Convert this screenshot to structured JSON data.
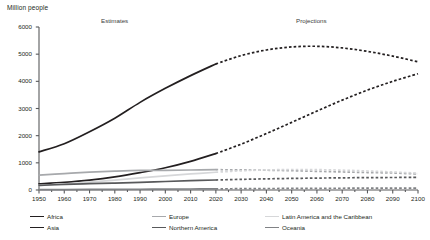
{
  "axis": {
    "ylabel": "Million people",
    "yticks": [
      0,
      1000,
      2000,
      3000,
      4000,
      5000,
      6000
    ],
    "ytick_labels": [
      "0",
      "1000",
      "2000",
      "3000",
      "4000",
      "5000",
      "6000"
    ],
    "xticks": [
      1950,
      1960,
      1970,
      1980,
      1990,
      2000,
      2010,
      2020,
      2030,
      2040,
      2050,
      2060,
      2070,
      2080,
      2090,
      2100
    ],
    "xtick_labels": [
      "1950",
      "1960",
      "1970",
      "1980",
      "1990",
      "2000",
      "2010",
      "2020",
      "2030",
      "2040",
      "2050",
      "2060",
      "2070",
      "2080",
      "2090",
      "2100"
    ]
  },
  "annotations": {
    "estimates": "Estimates",
    "projections": "Projections"
  },
  "legend": {
    "items": [
      {
        "label": "Africa",
        "color": "#231f20"
      },
      {
        "label": "Europe",
        "color": "#a7a9ac"
      },
      {
        "label": "Latin America and the Caribbean",
        "color": "#d6d7d9"
      },
      {
        "label": "Asia",
        "color": "#231f20"
      },
      {
        "label": "Northern America",
        "color": "#58595b"
      },
      {
        "label": "Oceania",
        "color": "#808285"
      }
    ]
  },
  "chart_data": {
    "type": "line",
    "title": "",
    "subtitle": "",
    "xlabel": "",
    "ylabel": "Million people",
    "xlim": [
      1950,
      2100
    ],
    "ylim": [
      0,
      6000
    ],
    "grid": false,
    "legend_position": "bottom",
    "split_year": 2020,
    "split_note": "solid line = estimates (1950-2020), dashed line = projections (2020-2100)",
    "x": [
      1950,
      1960,
      1970,
      1980,
      1990,
      2000,
      2010,
      2020,
      2030,
      2040,
      2050,
      2060,
      2070,
      2080,
      2090,
      2100
    ],
    "series": [
      {
        "name": "Asia",
        "color": "#231f20",
        "values": [
          1405,
          1704,
          2144,
          2642,
          3226,
          3741,
          4210,
          4641,
          4947,
          5154,
          5266,
          5290,
          5230,
          5103,
          4928,
          4719
        ]
      },
      {
        "name": "Africa",
        "color": "#231f20",
        "values": [
          228,
          285,
          366,
          482,
          638,
          818,
          1055,
          1341,
          1688,
          2077,
          2489,
          2905,
          3308,
          3677,
          3999,
          4280
        ]
      },
      {
        "name": "Europe",
        "color": "#a7a9ac",
        "values": [
          549,
          605,
          657,
          694,
          721,
          726,
          736,
          748,
          741,
          728,
          710,
          687,
          664,
          643,
          625,
          587
        ]
      },
      {
        "name": "Latin America and the Caribbean",
        "color": "#d6d7d9",
        "values": [
          169,
          220,
          288,
          364,
          447,
          522,
          591,
          654,
          706,
          739,
          754,
          749,
          730,
          700,
          663,
          621
        ]
      },
      {
        "name": "Northern America",
        "color": "#58595b",
        "values": [
          172,
          205,
          231,
          254,
          280,
          313,
          343,
          369,
          392,
          411,
          426,
          438,
          448,
          455,
          460,
          464
        ]
      },
      {
        "name": "Oceania",
        "color": "#808285",
        "values": [
          13,
          16,
          20,
          23,
          27,
          31,
          37,
          43,
          49,
          54,
          58,
          62,
          65,
          68,
          70,
          72
        ]
      }
    ]
  }
}
